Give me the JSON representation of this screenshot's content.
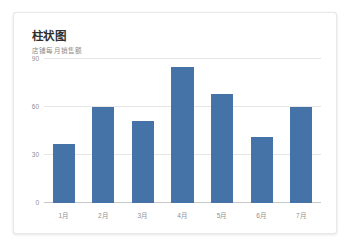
{
  "card": {
    "title": "柱状图",
    "subtitle": "店铺每月销售额",
    "background": "#ffffff",
    "border_color": "#e8e8e8"
  },
  "chart_data": {
    "type": "bar",
    "title": "柱状图",
    "subtitle": "店铺每月销售额",
    "categories": [
      "1月",
      "2月",
      "3月",
      "4月",
      "5月",
      "6月",
      "7月"
    ],
    "values": [
      37,
      60,
      51,
      85,
      68,
      41,
      60
    ],
    "xlabel": "",
    "ylabel": "",
    "ylim": [
      0,
      90
    ],
    "yticks": [
      0,
      30,
      60,
      90
    ],
    "ytick_labels": [
      "0",
      "30",
      "60",
      "90"
    ],
    "grid": true,
    "legend": false,
    "series": [
      {
        "name": "销售额",
        "color": "#4573a7",
        "values": [
          37,
          60,
          51,
          85,
          68,
          41,
          60
        ]
      }
    ],
    "colors": {
      "bar": "#4573a7",
      "gridline": "#e6e6e6",
      "axis": "#c9c9c9",
      "tick_text": "#8f8f8f",
      "title_text": "#303030",
      "subtitle_text": "#8a8a8a"
    }
  }
}
